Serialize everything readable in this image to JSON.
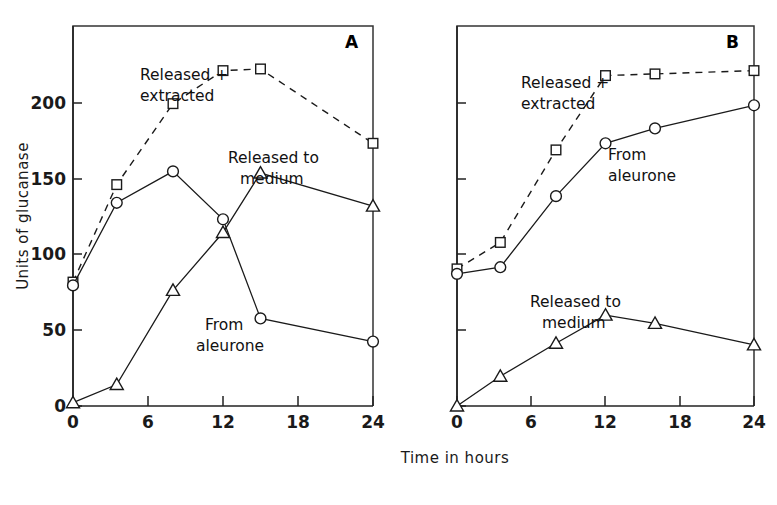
{
  "figure": {
    "xlabel": "Time in hours",
    "ylabel": "Units of glucanase",
    "panel_a_letter": "A",
    "panel_b_letter": "B"
  },
  "axis": {
    "x_ticks": [
      "0",
      "6",
      "12",
      "18",
      "24"
    ],
    "y_ticks": [
      "0",
      "50",
      "100",
      "150",
      "200"
    ]
  },
  "annotations": {
    "released_extracted_line1": "Released +",
    "released_extracted_line2": "extracted",
    "released_medium_line1": "Released to",
    "released_medium_line2": "medium",
    "from_aleurone_line1": "From",
    "from_aleurone_line2": "aleurone"
  },
  "chart_data": [
    {
      "type": "line",
      "panel": "A",
      "title": "A",
      "xlabel": "Time in hours",
      "ylabel": "Units of glucanase",
      "xlim": [
        0,
        24
      ],
      "ylim": [
        0,
        230
      ],
      "xticks": [
        0,
        6,
        12,
        18,
        24
      ],
      "yticks": [
        0,
        50,
        100,
        150,
        200
      ],
      "grid": false,
      "legend": "inline-annotations",
      "series": [
        {
          "name": "Released + extracted",
          "marker": "square",
          "linestyle": "dashed",
          "x": [
            0,
            3.5,
            8,
            12,
            15,
            24
          ],
          "values": [
            75,
            134,
            183,
            203,
            204,
            159
          ]
        },
        {
          "name": "Released to medium",
          "marker": "circle",
          "linestyle": "solid",
          "x": [
            0,
            3.5,
            8,
            12,
            15,
            24
          ],
          "values": [
            73,
            123,
            142,
            113,
            53,
            39
          ]
        },
        {
          "name": "From aleurone",
          "marker": "triangle",
          "linestyle": "solid",
          "x": [
            0,
            3.5,
            8,
            12,
            15,
            24
          ],
          "values": [
            2,
            13,
            70,
            105,
            141,
            121
          ]
        }
      ]
    },
    {
      "type": "line",
      "panel": "B",
      "title": "B",
      "xlabel": "Time in hours",
      "ylabel": "Units of glucanase",
      "xlim": [
        0,
        24
      ],
      "ylim": [
        0,
        230
      ],
      "xticks": [
        0,
        6,
        12,
        18,
        24
      ],
      "yticks": [
        0,
        50,
        100,
        150,
        200
      ],
      "grid": false,
      "legend": "inline-annotations",
      "series": [
        {
          "name": "Released + extracted",
          "marker": "square",
          "linestyle": "dashed",
          "x": [
            0,
            3.5,
            8,
            12,
            16,
            24
          ],
          "values": [
            83,
            99,
            155,
            200,
            201,
            203
          ]
        },
        {
          "name": "From aleurone",
          "marker": "circle",
          "linestyle": "solid",
          "x": [
            0,
            3.5,
            8,
            12,
            16,
            24
          ],
          "values": [
            80,
            84,
            127,
            159,
            168,
            182
          ]
        },
        {
          "name": "Released to medium",
          "marker": "triangle",
          "linestyle": "solid",
          "x": [
            0,
            3.5,
            8,
            12,
            16,
            24
          ],
          "values": [
            0,
            18,
            38,
            55,
            50,
            37
          ]
        }
      ]
    }
  ],
  "colors": {
    "ink": "#1a1a1a",
    "background": "#ffffff"
  }
}
